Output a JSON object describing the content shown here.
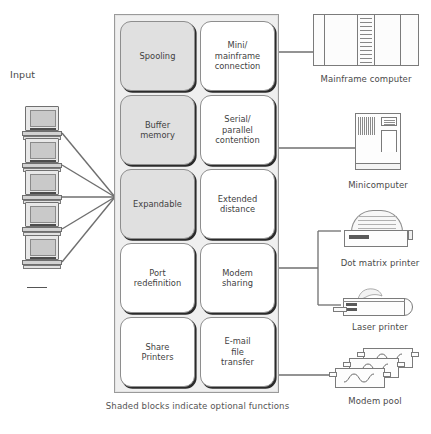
{
  "diagram": {
    "caption": "Shaded blocks indicate optional functions",
    "input_label": "Input"
  },
  "panel": {
    "cells": [
      {
        "label": "Spooling",
        "shaded": true,
        "row": 0,
        "col": 0
      },
      {
        "label": "Mini/\nmainframe\nconnection",
        "shaded": false,
        "row": 0,
        "col": 1
      },
      {
        "label": "Buffer\nmemory",
        "shaded": true,
        "row": 1,
        "col": 0
      },
      {
        "label": "Serial/\nparallel\ncontention",
        "shaded": false,
        "row": 1,
        "col": 1
      },
      {
        "label": "Expandable",
        "shaded": true,
        "row": 2,
        "col": 0
      },
      {
        "label": "Extended\ndistance",
        "shaded": false,
        "row": 2,
        "col": 1
      },
      {
        "label": "Port\nredefinition",
        "shaded": false,
        "row": 3,
        "col": 0
      },
      {
        "label": "Modem\nsharing",
        "shaded": false,
        "row": 3,
        "col": 1
      },
      {
        "label": "Share\nPrinters",
        "shaded": false,
        "row": 4,
        "col": 0
      },
      {
        "label": "E-mail\nfile\ntransfer",
        "shaded": false,
        "row": 4,
        "col": 1
      }
    ]
  },
  "terminals": [
    {
      "name": "terminal-1"
    },
    {
      "name": "terminal-2"
    },
    {
      "name": "terminal-3"
    },
    {
      "name": "terminal-4"
    },
    {
      "name": "terminal-5"
    }
  ],
  "devices": [
    {
      "id": "mainframe",
      "label": "Mainframe computer"
    },
    {
      "id": "mini",
      "label": "Minicomputer"
    },
    {
      "id": "dotmatrix",
      "label": "Dot matrix printer"
    },
    {
      "id": "laser",
      "label": "Laser printer"
    },
    {
      "id": "modems",
      "label": "Modem pool"
    }
  ],
  "colors": {
    "panel_background": "#efefef",
    "shaded_cell": "#e0e0e0",
    "plain_cell": "#ffffff",
    "line": "#6f6f6f",
    "text": "#4a4a4a"
  }
}
